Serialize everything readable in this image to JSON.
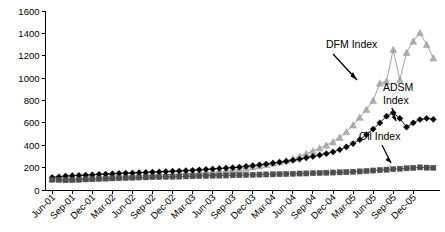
{
  "chart_data": {
    "type": "line",
    "title": "",
    "xlabel": "",
    "ylabel": "",
    "ylim": [
      0,
      1600
    ],
    "ytick_step": 200,
    "yticks": [
      0,
      200,
      400,
      600,
      800,
      1000,
      1200,
      1400,
      1600
    ],
    "grid": false,
    "legend_position": "inline-annotations",
    "x_tick_labels": [
      "Jun-01",
      "Sep-01",
      "Dec-01",
      "Mar-02",
      "Jun-02",
      "Sep-02",
      "Dec-02",
      "Mar-03",
      "Jun-03",
      "Sep-03",
      "Dec-03",
      "Mar-04",
      "Jun-04",
      "Sep-04",
      "Dec-04",
      "Mar-05",
      "Jun-05",
      "Sep-05",
      "Dec-05"
    ],
    "x_tick_interval_months": 3,
    "x_point_interval_months": 1,
    "x_start": "Jun-01",
    "x_end": "Dec-05",
    "annotations": [
      {
        "text": "DFM Index",
        "target_series": "DFM Index"
      },
      {
        "text": "ADSM",
        "text2": "Index",
        "target_series": "ADSM Index"
      },
      {
        "text": "Oil Index",
        "target_series": "Oil Index"
      }
    ],
    "series": [
      {
        "name": "DFM Index",
        "color": "#999999",
        "marker": "triangle",
        "values": [
          100,
          102,
          100,
          98,
          100,
          103,
          105,
          108,
          112,
          115,
          118,
          120,
          122,
          125,
          128,
          130,
          133,
          136,
          140,
          142,
          145,
          148,
          152,
          155,
          160,
          165,
          170,
          178,
          185,
          195,
          205,
          215,
          228,
          240,
          252,
          265,
          280,
          300,
          325,
          350,
          375,
          400,
          430,
          470,
          520,
          580,
          650,
          720,
          800,
          955,
          970,
          1255,
          985,
          1230,
          1330,
          1405,
          1300,
          1180
        ]
      },
      {
        "name": "ADSM Index",
        "color": "#000000",
        "marker": "diamond",
        "values": [
          112,
          118,
          125,
          128,
          130,
          133,
          136,
          140,
          142,
          145,
          148,
          150,
          152,
          155,
          157,
          160,
          162,
          165,
          168,
          170,
          173,
          176,
          180,
          184,
          188,
          192,
          196,
          200,
          205,
          212,
          218,
          225,
          232,
          240,
          248,
          256,
          265,
          275,
          288,
          300,
          312,
          325,
          340,
          360,
          385,
          415,
          450,
          495,
          545,
          600,
          660,
          690,
          640,
          562,
          600,
          630,
          640,
          632
        ]
      },
      {
        "name": "Oil Index",
        "color": "#4d4d4d",
        "marker": "square",
        "values": [
          92,
          90,
          88,
          90,
          92,
          95,
          97,
          100,
          102,
          104,
          106,
          108,
          110,
          112,
          113,
          115,
          116,
          118,
          119,
          120,
          122,
          123,
          125,
          126,
          128,
          129,
          130,
          132,
          133,
          135,
          136,
          138,
          139,
          140,
          142,
          143,
          145,
          147,
          148,
          150,
          152,
          154,
          156,
          158,
          160,
          163,
          166,
          170,
          174,
          178,
          182,
          186,
          190,
          194,
          198,
          202,
          200,
          198
        ]
      }
    ]
  }
}
